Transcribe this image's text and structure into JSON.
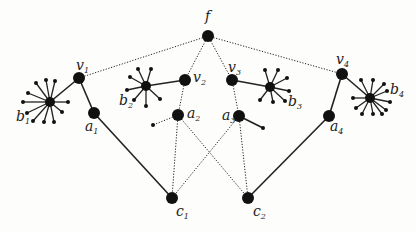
{
  "diagram": {
    "colors": {
      "node": "#111111",
      "edge": "#222222",
      "background": "#fdfdfb"
    },
    "nodes": [
      {
        "id": "f",
        "label": "f",
        "sub": "",
        "x": 208,
        "y": 36,
        "r": 6,
        "lx": 205,
        "ly": 21
      },
      {
        "id": "v1",
        "label": "v",
        "sub": "1",
        "x": 79,
        "y": 78,
        "r": 6,
        "lx": 76,
        "ly": 70
      },
      {
        "id": "v2",
        "label": "v",
        "sub": "2",
        "x": 185,
        "y": 80,
        "r": 6,
        "lx": 193,
        "ly": 82
      },
      {
        "id": "v3",
        "label": "v",
        "sub": "3",
        "x": 232,
        "y": 80,
        "r": 6,
        "lx": 228,
        "ly": 72
      },
      {
        "id": "v4",
        "label": "v",
        "sub": "4",
        "x": 342,
        "y": 74,
        "r": 6,
        "lx": 336,
        "ly": 64
      },
      {
        "id": "a1",
        "label": "a",
        "sub": "1",
        "x": 94,
        "y": 113,
        "r": 6,
        "lx": 85,
        "ly": 131
      },
      {
        "id": "a2",
        "label": "a",
        "sub": "2",
        "x": 178,
        "y": 115,
        "r": 6,
        "lx": 187,
        "ly": 118
      },
      {
        "id": "a3",
        "label": "a",
        "sub": "3",
        "x": 239,
        "y": 116,
        "r": 6,
        "lx": 222,
        "ly": 120
      },
      {
        "id": "a4",
        "label": "a",
        "sub": "4",
        "x": 329,
        "y": 116,
        "r": 6,
        "lx": 330,
        "ly": 131
      },
      {
        "id": "c1",
        "label": "c",
        "sub": "1",
        "x": 172,
        "y": 198,
        "r": 6,
        "lx": 176,
        "ly": 216
      },
      {
        "id": "c2",
        "label": "c",
        "sub": "2",
        "x": 248,
        "y": 198,
        "r": 6,
        "lx": 253,
        "ly": 216
      },
      {
        "id": "b1",
        "label": "b",
        "sub": "1",
        "x": 50,
        "y": 102,
        "r": 5,
        "lx": 16,
        "ly": 121
      },
      {
        "id": "b2",
        "label": "b",
        "sub": "2",
        "x": 146,
        "y": 86,
        "r": 5,
        "lx": 119,
        "ly": 105
      },
      {
        "id": "b3",
        "label": "b",
        "sub": "3",
        "x": 270,
        "y": 87,
        "r": 5,
        "lx": 288,
        "ly": 106
      },
      {
        "id": "b4",
        "label": "b",
        "sub": "4",
        "x": 370,
        "y": 98,
        "r": 5,
        "lx": 390,
        "ly": 94
      }
    ],
    "edges": [
      {
        "from": "f",
        "to": "v1",
        "style": "dotted"
      },
      {
        "from": "f",
        "to": "v2",
        "style": "dotted"
      },
      {
        "from": "f",
        "to": "v3",
        "style": "dotted"
      },
      {
        "from": "f",
        "to": "v4",
        "style": "dotted"
      },
      {
        "from": "v1",
        "to": "a1",
        "style": "solid"
      },
      {
        "from": "v1",
        "to": "b1",
        "style": "solid"
      },
      {
        "from": "v2",
        "to": "a2",
        "style": "dotted"
      },
      {
        "from": "v2",
        "to": "b2",
        "style": "solid"
      },
      {
        "from": "v3",
        "to": "a3",
        "style": "dotted"
      },
      {
        "from": "v3",
        "to": "b3",
        "style": "solid"
      },
      {
        "from": "v4",
        "to": "a4",
        "style": "solid"
      },
      {
        "from": "v4",
        "to": "b4",
        "style": "solid"
      },
      {
        "from": "a1",
        "to": "c1",
        "style": "solid"
      },
      {
        "from": "a4",
        "to": "c2",
        "style": "solid"
      },
      {
        "from": "a2",
        "to": "c1",
        "style": "dotted"
      },
      {
        "from": "a2",
        "to": "c2",
        "style": "dotted"
      },
      {
        "from": "a3",
        "to": "c1",
        "style": "dotted"
      },
      {
        "from": "a3",
        "to": "c2",
        "style": "dotted"
      }
    ],
    "leaves": [
      {
        "parent": "a2",
        "x": 153,
        "y": 125,
        "style": "dotted"
      },
      {
        "parent": "a3",
        "x": 263,
        "y": 128,
        "style": "solid"
      }
    ],
    "stars": [
      {
        "center": "b1",
        "spokes": [
          [
            36,
            83
          ],
          [
            46,
            80
          ],
          [
            55,
            81
          ],
          [
            28,
            93
          ],
          [
            23,
            102
          ],
          [
            68,
            102
          ],
          [
            27,
            113
          ],
          [
            62,
            112
          ],
          [
            33,
            121
          ],
          [
            44,
            122
          ],
          [
            54,
            122
          ]
        ]
      },
      {
        "center": "b2",
        "spokes": [
          [
            138,
            69
          ],
          [
            151,
            69
          ],
          [
            130,
            77
          ],
          [
            127,
            90
          ],
          [
            134,
            100
          ],
          [
            160,
            99
          ],
          [
            146,
            106
          ]
        ]
      },
      {
        "center": "b3",
        "spokes": [
          [
            265,
            70
          ],
          [
            278,
            70
          ],
          [
            287,
            78
          ],
          [
            289,
            91
          ],
          [
            260,
            100
          ],
          [
            273,
            102
          ],
          [
            285,
            101
          ]
        ]
      },
      {
        "center": "b4",
        "spokes": [
          [
            361,
            80
          ],
          [
            373,
            80
          ],
          [
            384,
            84
          ],
          [
            387,
            91
          ],
          [
            353,
            98
          ],
          [
            390,
            102
          ],
          [
            356,
            108
          ],
          [
            386,
            110
          ],
          [
            362,
            114
          ],
          [
            373,
            114
          ],
          [
            382,
            114
          ]
        ]
      }
    ]
  }
}
